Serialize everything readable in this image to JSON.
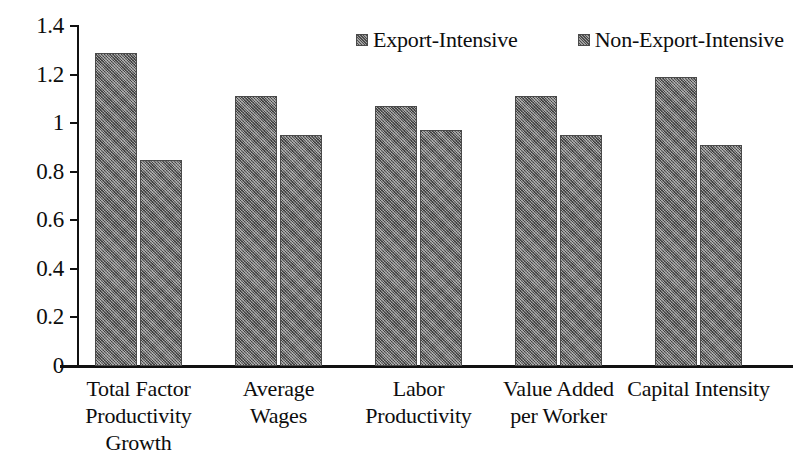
{
  "chart_data": {
    "type": "bar",
    "title": "",
    "subtitle": "",
    "xlabel": "",
    "ylabel": "",
    "ylim": [
      0,
      1.4
    ],
    "yticks": [
      0,
      0.2,
      0.4,
      0.6,
      0.8,
      1,
      1.2,
      1.4
    ],
    "ytick_labels": [
      "0",
      "0.2",
      "0.4",
      "0.6",
      "0.8",
      "1",
      "1.2",
      "1.4"
    ],
    "grid": false,
    "legend_position": "top-center",
    "orientation": "vertical",
    "grouping": "grouped",
    "categories": [
      "Total Factor\nProductivity\nGrowth",
      "Average\nWages",
      "Labor\nProductivity",
      "Value Added\nper Worker",
      "Capital Intensity"
    ],
    "series": [
      {
        "name": "Export-Intensive",
        "color": "#6e6e6e",
        "values": [
          1.29,
          1.11,
          1.07,
          1.11,
          1.19
        ]
      },
      {
        "name": "Non-Export-Intensive",
        "color": "#6e6e6e",
        "values": [
          0.85,
          0.95,
          0.97,
          0.95,
          0.91
        ]
      }
    ]
  },
  "legend": {
    "items": [
      {
        "label": "Export-Intensive"
      },
      {
        "label": "Non-Export-Intensive"
      }
    ]
  },
  "axis": {
    "y_tick_labels": [
      "1.4",
      "1.2",
      "1",
      "0.8",
      "0.6",
      "0.4",
      "0.2",
      "0"
    ]
  }
}
